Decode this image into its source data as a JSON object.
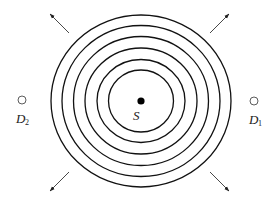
{
  "diagram": {
    "title": "",
    "source": {
      "label": "S",
      "cx": 141,
      "cy": 101,
      "r": 3.6,
      "color": "#000000"
    },
    "wavefronts": [
      {
        "rx": 90,
        "ry": 86
      },
      {
        "rx": 79,
        "ry": 75.5
      },
      {
        "rx": 67.5,
        "ry": 64.5
      },
      {
        "rx": 56,
        "ry": 53
      },
      {
        "rx": 44,
        "ry": 41.5
      },
      {
        "rx": 32.5,
        "ry": 31
      }
    ],
    "detectors": [
      {
        "id": "D1",
        "letter": "D",
        "subscript": "1",
        "cx": 254,
        "cy": 101,
        "r": 4,
        "label_x": 249,
        "label_y": 124
      },
      {
        "id": "D2",
        "letter": "D",
        "subscript": "2",
        "cx": 22,
        "cy": 100,
        "r": 4,
        "label_x": 16,
        "label_y": 123
      }
    ],
    "arrows": [
      {
        "name": "arrow-up-left",
        "x1": 69,
        "y1": 33,
        "x2": 50,
        "y2": 14
      },
      {
        "name": "arrow-up-right",
        "x1": 210,
        "y1": 33,
        "x2": 229,
        "y2": 14
      },
      {
        "name": "arrow-down-left",
        "x1": 69,
        "y1": 172,
        "x2": 50,
        "y2": 191
      },
      {
        "name": "arrow-down-right",
        "x1": 210,
        "y1": 172,
        "x2": 229,
        "y2": 191
      }
    ]
  }
}
